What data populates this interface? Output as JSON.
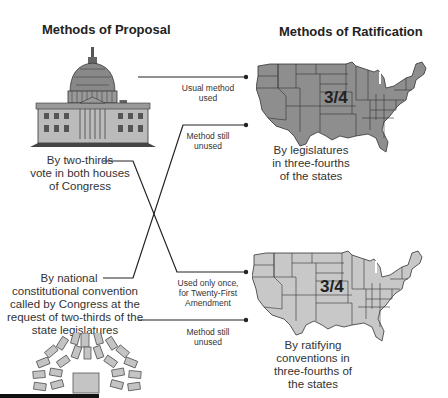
{
  "headings": {
    "proposal": "Methods of Proposal",
    "ratification": "Methods of Ratification"
  },
  "proposal_methods": [
    {
      "label": "By two-thirds vote in both houses of Congress",
      "lines": [
        "By two-thirds",
        "vote in both houses",
        "of Congress"
      ],
      "icon": "capitol-building-icon"
    },
    {
      "label": "By national constitutional convention called by Congress at the request of two-thirds of the state legislatures",
      "lines": [
        "By national",
        "constitutional convention",
        "called by Congress at the",
        "request of two-thirds of the",
        "state legislatures"
      ],
      "icon": "convention-seating-icon"
    }
  ],
  "ratification_methods": [
    {
      "label": "By legislatures in three-fourths of the states",
      "lines": [
        "By legislatures",
        "in three-fourths",
        "of the states"
      ],
      "fraction": "3/4",
      "map_color": "#8e8e8e"
    },
    {
      "label": "By ratifying conventions in three-fourths of the states",
      "lines": [
        "By ratifying",
        "conventions in",
        "three-fourths of",
        "the states"
      ],
      "fraction": "3/4",
      "map_color": "#c8c8c8"
    }
  ],
  "connectors": [
    {
      "from": "Congress",
      "to": "State legislatures",
      "lines": [
        "Usual method",
        "used"
      ]
    },
    {
      "from": "National convention",
      "to": "State legislatures",
      "lines": [
        "Method still",
        "unused"
      ]
    },
    {
      "from": "Congress",
      "to": "State conventions",
      "lines": [
        "Used only once,",
        "for Twenty-First",
        "Amendment"
      ]
    },
    {
      "from": "National convention",
      "to": "State conventions",
      "lines": [
        "Method still",
        "unused"
      ]
    }
  ]
}
